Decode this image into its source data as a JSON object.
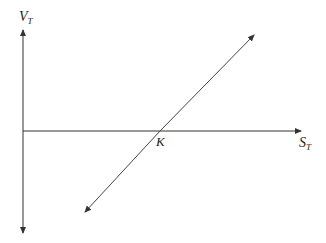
{
  "diagram": {
    "y_axis": {
      "label_main": "V",
      "label_sub": "T"
    },
    "x_axis": {
      "label_main": "S",
      "label_sub": "T"
    },
    "strike_label": "K",
    "colors": {
      "line": "#333333",
      "text": "#222222",
      "background": "#ffffff"
    }
  }
}
